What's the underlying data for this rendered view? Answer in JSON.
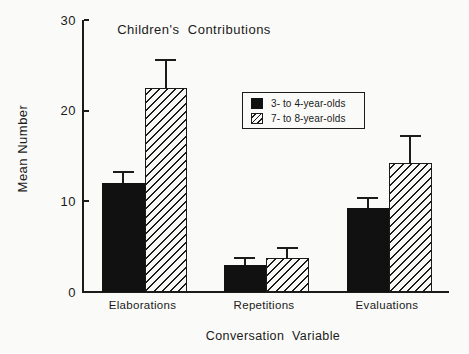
{
  "colors": {
    "background": "#fafaf8",
    "ink": "#1b1b1b",
    "bar_fill": "#111111",
    "hatch_paper": "#f8f8f6"
  },
  "chart_data": {
    "type": "bar",
    "title": "Children's  Contributions",
    "xlabel": "Conversation  Variable",
    "ylabel": "Mean Number",
    "categories": [
      "Elaborations",
      "Repetitions",
      "Evaluations"
    ],
    "series": [
      {
        "name": "3- to 4-year-olds",
        "style": "solid-black",
        "values": [
          12.0,
          3.0,
          9.3
        ],
        "upper_errors": [
          1.2,
          0.7,
          1.1
        ]
      },
      {
        "name": "7- to 8-year-olds",
        "style": "diagonal-hatch",
        "values": [
          22.5,
          3.8,
          14.2
        ],
        "upper_errors": [
          3.1,
          1.0,
          3.0
        ]
      }
    ],
    "yticks": [
      0,
      10,
      20,
      30
    ],
    "ylim": [
      0,
      30
    ],
    "grid": false,
    "legend_position": "inside-upper-right",
    "error_bars": "upper-only-with-caps"
  }
}
